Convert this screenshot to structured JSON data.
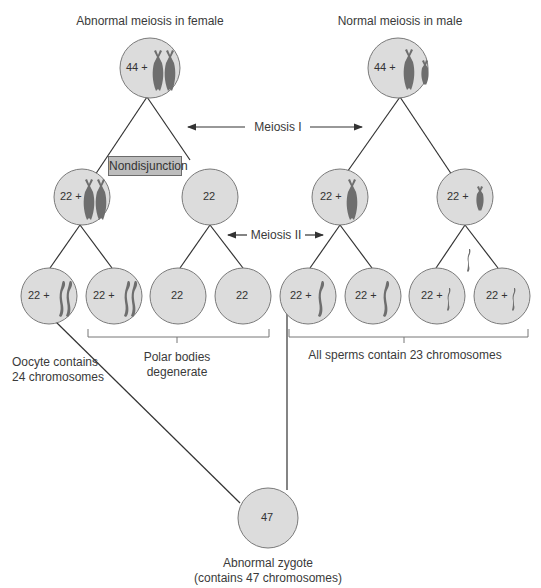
{
  "titles": {
    "female": "Abnormal meiosis in female",
    "male": "Normal meiosis in male"
  },
  "stage_labels": {
    "meiosis1": "Meiosis I",
    "meiosis2": "Meiosis II"
  },
  "event_label": "Nondisjunction",
  "cells": {
    "female_parent": "44 +",
    "female_m1_left": "22 +",
    "female_m1_right": "22",
    "female_m2_1": "22 +",
    "female_m2_2": "22 +",
    "female_m2_3": "22",
    "female_m2_4": "22",
    "male_parent": "44 +",
    "male_m1_left": "22 +",
    "male_m1_right": "22 +",
    "male_m2_1": "22 +",
    "male_m2_2": "22 +",
    "male_m2_3": "22 +",
    "male_m2_4": "22 +",
    "zygote": "47"
  },
  "annotations": {
    "oocyte_line1": "Oocyte contains",
    "oocyte_line2": "24 chromosomes",
    "polar_line1": "Polar bodies",
    "polar_line2": "degenerate",
    "sperms": "All sperms contain 23 chromosomes",
    "zygote_line1": "Abnormal zygote",
    "zygote_line2": "(contains 47 chromosomes)"
  },
  "colors": {
    "cell_fill": "#dcdcdc",
    "cell_stroke": "#7a7a7a",
    "chromosome": "#6e6e6e",
    "line": "#333333",
    "box_fill": "#bdbdbd"
  }
}
